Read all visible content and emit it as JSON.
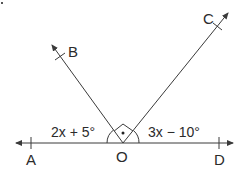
{
  "diagram": {
    "type": "geometry-angles",
    "colors": {
      "stroke": "#3a3a3a",
      "text": "#2b2b2b",
      "background": "#ffffff"
    },
    "points": {
      "A": {
        "label": "A"
      },
      "B": {
        "label": "B"
      },
      "C": {
        "label": "C"
      },
      "D": {
        "label": "D"
      },
      "O": {
        "label": "O"
      }
    },
    "angles": {
      "AOB": {
        "label": "2x + 5°"
      },
      "BOC": {
        "label": "right-angle",
        "marker": "square-with-dot"
      },
      "COD": {
        "label": "3x − 10°"
      }
    },
    "lines": [
      "line AD",
      "ray OB",
      "ray OC"
    ]
  }
}
